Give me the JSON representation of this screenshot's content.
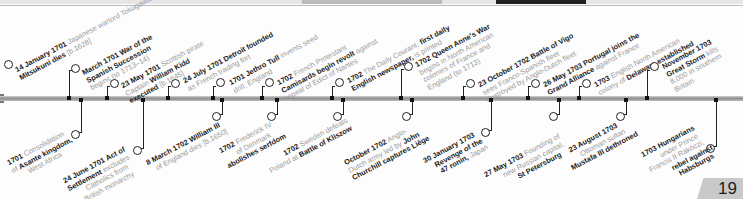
{
  "page": {
    "number": "19"
  },
  "events_above": [
    {
      "date": "14 January 1701",
      "text": "Japanese warlord Tokugawa",
      "bold2": "Mitsukuni dies",
      "rest": "[b.1628]"
    },
    {
      "date": "March 1701",
      "bold1": "War of the",
      "bold2": "Spanish Succession",
      "rest": "begins (to 1713–14)"
    },
    {
      "date": "23 May 1701",
      "text": "Scottish pirate",
      "line2a": "Captain ",
      "bold2": "William Kidd",
      "bold3": "executed",
      "rest": "[b.1645]"
    },
    {
      "date": "24 July 1701",
      "bold1": "Detroit founded",
      "rest": "as French trading fort"
    },
    {
      "date": "1701",
      "bold1": "Jethro Tull",
      "text": "invents seed",
      "rest": "drill, England"
    },
    {
      "date": "1702",
      "text": "French Protestant",
      "bold2": "Camisards begin revolt",
      "rest2": "against",
      "rest": "repeal of Edict of Nantes"
    },
    {
      "date": "1702",
      "text": "The Daily Courant,",
      "bold1": "first daily",
      "bold2": "English newspaper,",
      "rest": "is printed"
    },
    {
      "date": "1702",
      "bold1": "Queen Anne's War",
      "text": "begins in North American",
      "line3": "colonies of France and",
      "rest": "England (to 1713)"
    },
    {
      "date": "23 October 1702",
      "bold1": "Battle of Vigo",
      "text": "sees Franco-Spanish fleet",
      "rest": "destroyed by Anglo-Dutch fleet"
    },
    {
      "date": "26 May 1703",
      "bold1": "Portugal joins the",
      "bold2": "Grand Alliance",
      "rest": "against France"
    },
    {
      "date": "1703",
      "text": "English North American",
      "line2a": "colony of ",
      "bold2": "Delaware established"
    },
    {
      "date": "November 1703",
      "bold2": "Great Storm",
      "text": "kills",
      "line3": "8,000 in southern",
      "rest": "Britain"
    }
  ],
  "events_below": [
    {
      "date": "1701",
      "text": "Consolidation",
      "line2a": "of ",
      "bold2": "Asante kingdom,",
      "rest": "West Africa"
    },
    {
      "date": "24 June 1701",
      "bold1": "Act of",
      "bold2": "Settlement",
      "text": "excludes",
      "line3": "Catholics from",
      "rest": "British monarchy"
    },
    {
      "date": "8 March 1702",
      "bold1": "William III",
      "rest": "of England dies [b.1650]"
    },
    {
      "date": "1702",
      "text": "Frederick IV",
      "line2": "of Denmark",
      "bold3": "abolishes serfdom"
    },
    {
      "date": "1702",
      "text": "Sweden defeats",
      "line2a": "Poland at ",
      "bold2": "Battle of Kliszow"
    },
    {
      "date": "October 1702",
      "text": "Anglo-",
      "line2": "Dutch army led by",
      "bold2b": "John",
      "bold3": "Churchill captures Liège"
    },
    {
      "date": "30 January 1703",
      "bold2": "Revenge of the",
      "bold3": "47 ronin,",
      "rest": "Japan"
    },
    {
      "date": "27 May 1703",
      "text": "Founding of",
      "line2": "new Russian capital,",
      "bold3": "St Petersburg"
    },
    {
      "date": "23 August 1703",
      "line2": "Ottoman sultan",
      "bold3": "Mustafa III dethroned"
    },
    {
      "date": "1703",
      "bold1": "Hungarians",
      "line2": "under Prince",
      "line3": "Francis II Rákóczi,",
      "bold4": "rebel against",
      "bold5": "Habsburgs"
    }
  ]
}
